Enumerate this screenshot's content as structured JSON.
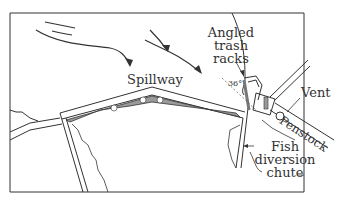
{
  "diagram": {
    "labels": {
      "spillway": "Spillway",
      "trash_racks": [
        "Angled",
        "trash",
        "racks"
      ],
      "angle": "36°",
      "vent": "Vent",
      "penstock": "Penstock",
      "fish_chute": [
        "Fish",
        "diversion",
        "chute"
      ]
    },
    "colors": {
      "line": "#333333",
      "fill": "#9a9a9a",
      "background": "#ffffff"
    }
  }
}
